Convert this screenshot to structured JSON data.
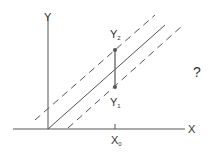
{
  "diagram": {
    "type": "regression-prediction-interval",
    "axes": {
      "x_label": "X",
      "y_label": "Y"
    },
    "x_tick_label": {
      "base": "X",
      "sub": "0"
    },
    "points": [
      {
        "base": "Y",
        "sub": "2"
      },
      {
        "base": "Y",
        "sub": "1"
      }
    ],
    "annotation": "?",
    "colors": {
      "line": "#555555",
      "point": "#555555",
      "text": "#333333"
    }
  }
}
